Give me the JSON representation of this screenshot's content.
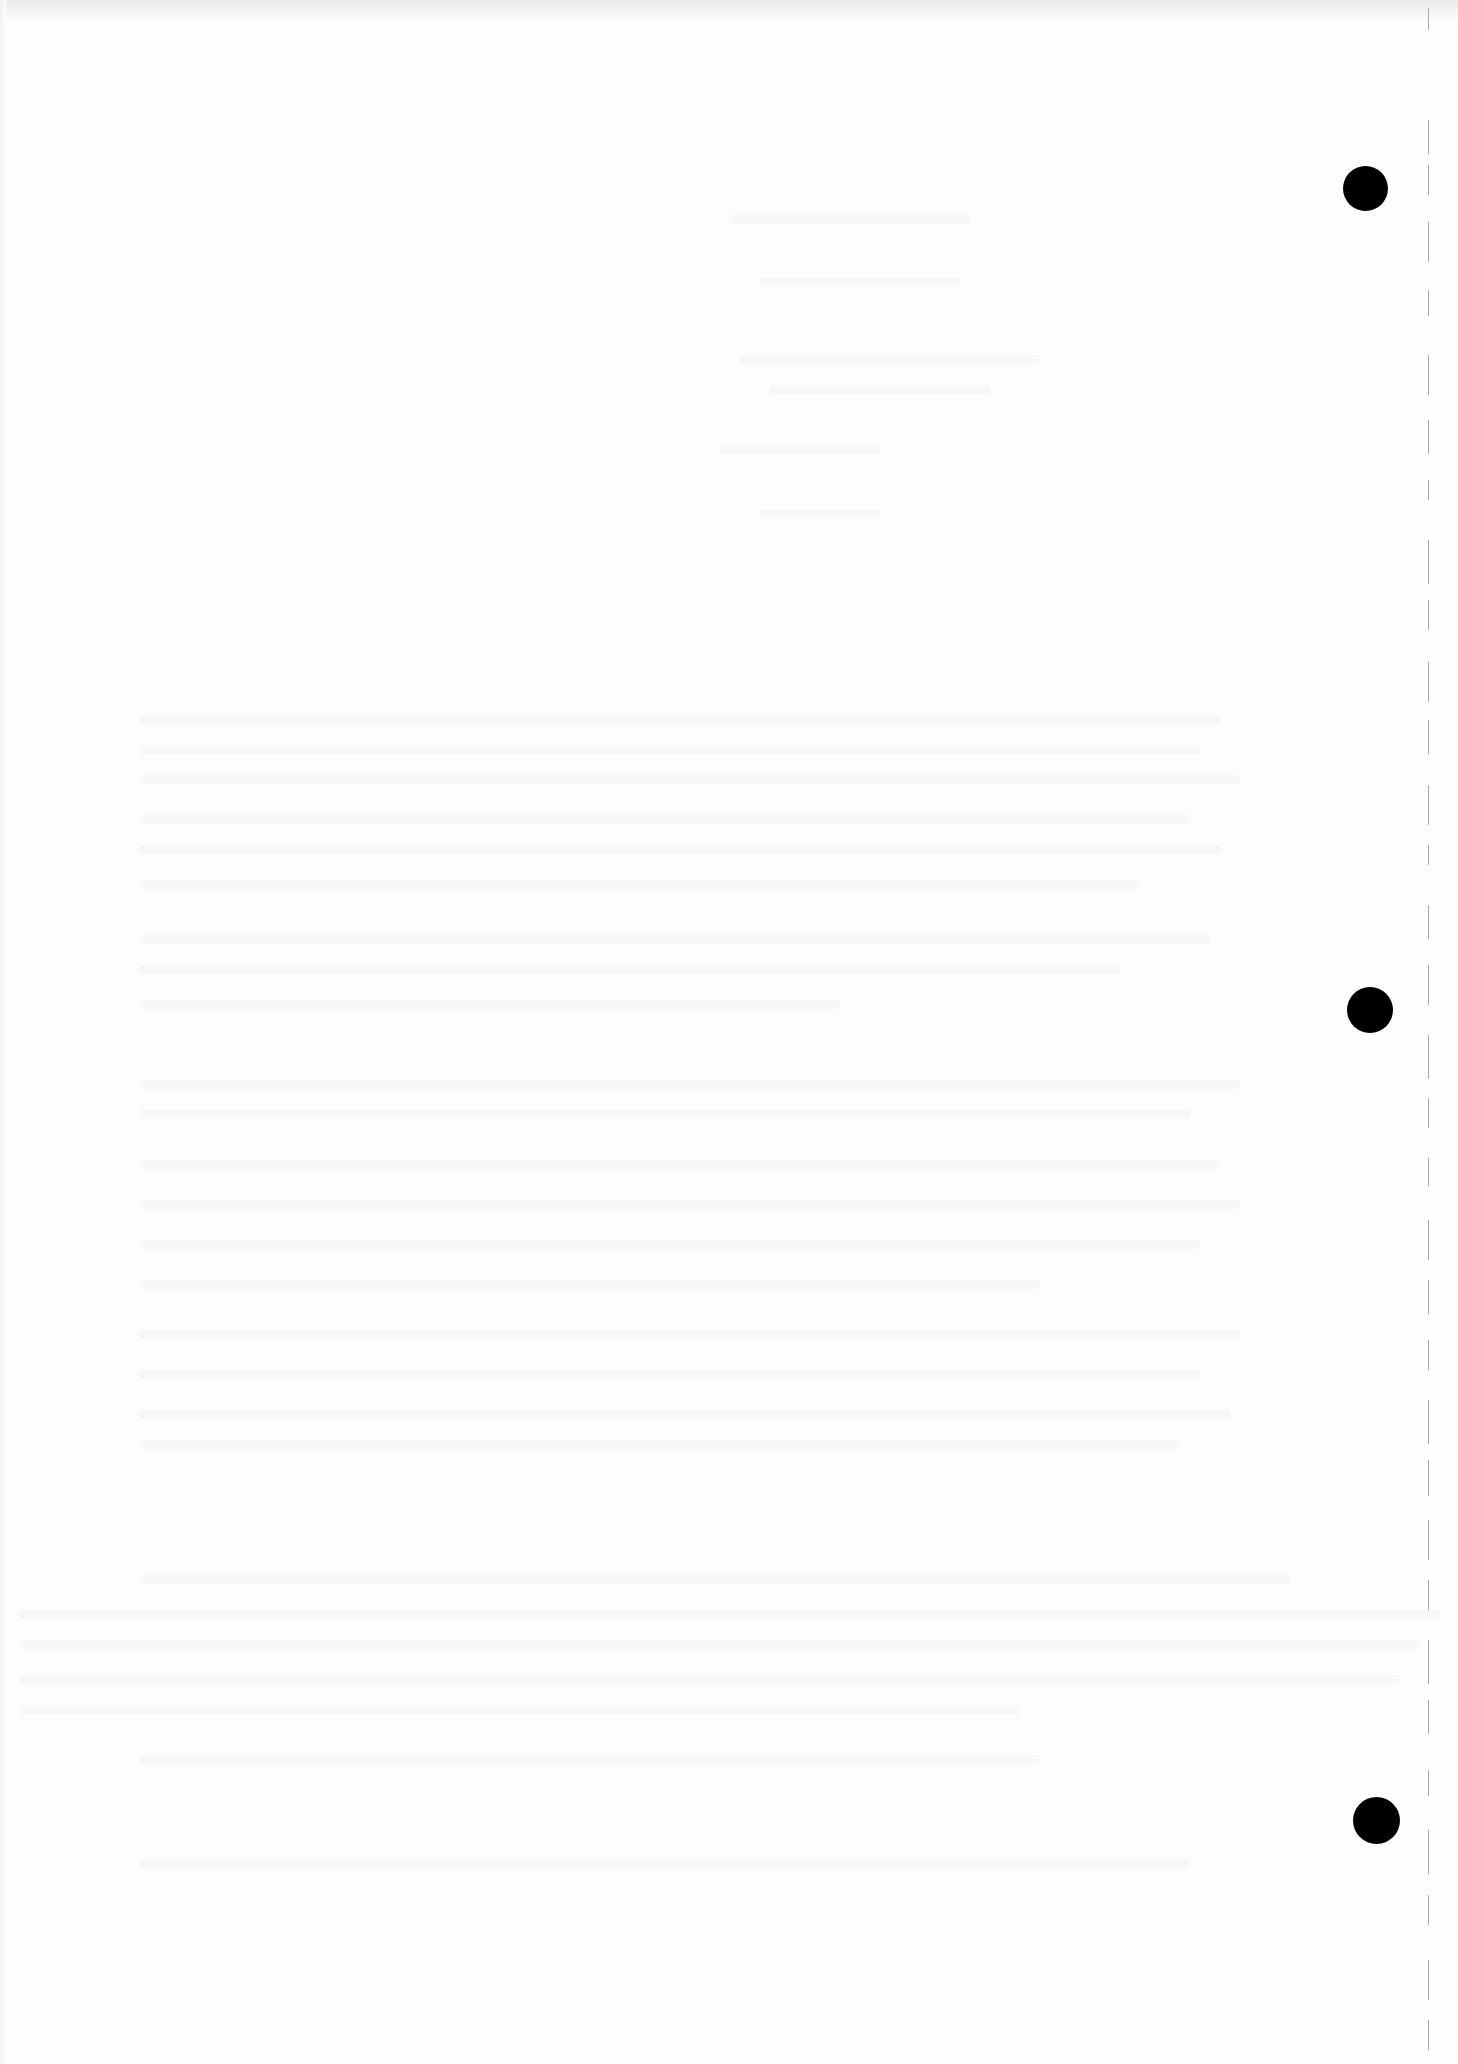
{
  "document": {
    "type": "scanned blank page (reverse side with show-through)",
    "background_color": "#fdfdfd",
    "legible_text": []
  },
  "punch_holes": [
    {
      "cx": 1365,
      "cy": 188,
      "diameter": 45,
      "color": "#000000"
    },
    {
      "cx": 1370,
      "cy": 1010,
      "diameter": 46,
      "color": "#000000"
    },
    {
      "cx": 1376,
      "cy": 1820,
      "diameter": 47,
      "color": "#000000"
    }
  ],
  "perforation": {
    "x": 1428,
    "color": "#a8a8a8",
    "dashes": [
      [
        8,
        22
      ],
      [
        120,
        34
      ],
      [
        165,
        30
      ],
      [
        222,
        40
      ],
      [
        290,
        26
      ],
      [
        355,
        40
      ],
      [
        420,
        34
      ],
      [
        480,
        20
      ],
      [
        540,
        44
      ],
      [
        600,
        30
      ],
      [
        662,
        40
      ],
      [
        720,
        34
      ],
      [
        785,
        40
      ],
      [
        845,
        20
      ],
      [
        905,
        34
      ],
      [
        965,
        40
      ],
      [
        1035,
        44
      ],
      [
        1098,
        30
      ],
      [
        1158,
        28
      ],
      [
        1220,
        40
      ],
      [
        1280,
        34
      ],
      [
        1340,
        30
      ],
      [
        1400,
        44
      ],
      [
        1460,
        36
      ],
      [
        1520,
        40
      ],
      [
        1580,
        30
      ],
      [
        1640,
        44
      ],
      [
        1700,
        34
      ],
      [
        1770,
        26
      ],
      [
        1830,
        44
      ],
      [
        1895,
        30
      ],
      [
        1960,
        40
      ],
      [
        2020,
        30
      ]
    ]
  },
  "bleed_through_lines": [
    {
      "x": 730,
      "y": 215,
      "w": 240
    },
    {
      "x": 760,
      "y": 278,
      "w": 200
    },
    {
      "x": 740,
      "y": 355,
      "w": 300
    },
    {
      "x": 770,
      "y": 385,
      "w": 220
    },
    {
      "x": 720,
      "y": 445,
      "w": 160
    },
    {
      "x": 760,
      "y": 510,
      "w": 120
    },
    {
      "x": 140,
      "y": 715,
      "w": 1080
    },
    {
      "x": 140,
      "y": 745,
      "w": 1060
    },
    {
      "x": 140,
      "y": 775,
      "w": 1100
    },
    {
      "x": 140,
      "y": 815,
      "w": 1050
    },
    {
      "x": 140,
      "y": 845,
      "w": 1080
    },
    {
      "x": 140,
      "y": 880,
      "w": 1000
    },
    {
      "x": 140,
      "y": 935,
      "w": 1070
    },
    {
      "x": 140,
      "y": 965,
      "w": 980
    },
    {
      "x": 140,
      "y": 1000,
      "w": 700
    },
    {
      "x": 140,
      "y": 1080,
      "w": 1100
    },
    {
      "x": 140,
      "y": 1110,
      "w": 1050
    },
    {
      "x": 140,
      "y": 1160,
      "w": 1080
    },
    {
      "x": 140,
      "y": 1200,
      "w": 1100
    },
    {
      "x": 140,
      "y": 1240,
      "w": 1060
    },
    {
      "x": 140,
      "y": 1280,
      "w": 900
    },
    {
      "x": 140,
      "y": 1330,
      "w": 1100
    },
    {
      "x": 140,
      "y": 1370,
      "w": 1060
    },
    {
      "x": 140,
      "y": 1410,
      "w": 1090
    },
    {
      "x": 140,
      "y": 1440,
      "w": 1040
    },
    {
      "x": 140,
      "y": 1575,
      "w": 1150
    },
    {
      "x": 20,
      "y": 1610,
      "w": 1420
    },
    {
      "x": 20,
      "y": 1640,
      "w": 1400
    },
    {
      "x": 20,
      "y": 1675,
      "w": 1380
    },
    {
      "x": 20,
      "y": 1705,
      "w": 1000
    },
    {
      "x": 140,
      "y": 1755,
      "w": 900
    },
    {
      "x": 140,
      "y": 1860,
      "w": 1050
    }
  ]
}
